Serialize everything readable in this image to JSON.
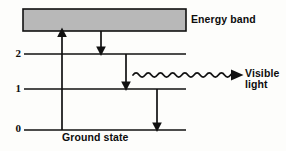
{
  "diagram": {
    "background_color": "#fdfdfb",
    "stroke_color": "#111111",
    "band_fill_color": "#b8b8b8",
    "band_label": "Energy band",
    "ground_state_label": "Ground state",
    "emission_label_line1": "Visible",
    "emission_label_line2": "light",
    "levels": [
      {
        "name": "level-2",
        "label": "2",
        "y": 54
      },
      {
        "name": "level-1",
        "label": "1",
        "y": 89
      },
      {
        "name": "level-0",
        "label": "0",
        "y": 130
      }
    ],
    "band": {
      "x": 23,
      "y": 9,
      "width": 163,
      "height": 22
    },
    "level_line": {
      "x_start": 24,
      "x_end": 186
    },
    "transitions": [
      {
        "name": "excitation-arrow",
        "direction": "up",
        "x": 62,
        "from_y": 130,
        "to_y": 31
      },
      {
        "name": "band-to-level2-arrow",
        "direction": "down",
        "x": 101,
        "from_y": 31,
        "to_y": 54
      },
      {
        "name": "level2-to-level1-arrow",
        "direction": "down",
        "x": 126,
        "from_y": 54,
        "to_y": 89
      },
      {
        "name": "level1-to-ground-arrow",
        "direction": "down",
        "x": 157,
        "from_y": 89,
        "to_y": 130
      }
    ],
    "photon_wave": {
      "x_start": 133,
      "x_end": 243,
      "y": 75,
      "amplitude": 3.2,
      "cycles": 9
    }
  }
}
